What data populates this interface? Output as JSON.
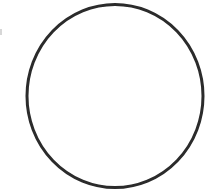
{
  "canvas": {
    "width": 208,
    "height": 196,
    "background": "#ffffff"
  },
  "shapes": [
    {
      "type": "ellipse",
      "label": "circle-outline",
      "cx": 115,
      "cy": 96,
      "rx": 88,
      "ry": 91.5,
      "stroke": "#2b2b2b",
      "stroke_width": 3,
      "fill": "none"
    }
  ],
  "artifacts": [
    {
      "type": "speck",
      "x": 0,
      "y": 29,
      "width": 2,
      "height": 6,
      "color": "#bdbdbd"
    }
  ]
}
